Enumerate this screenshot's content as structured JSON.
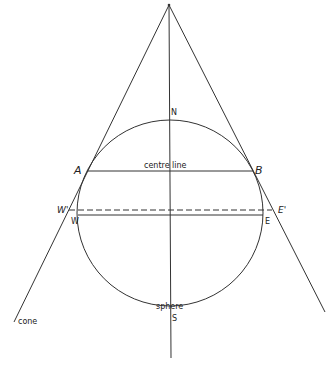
{
  "diagram": {
    "stroke_color": "#333333",
    "background": "#ffffff",
    "labels": {
      "north": "N",
      "south": "S",
      "point_a": "A",
      "point_b": "B",
      "west": "W",
      "east": "E",
      "west_prime": "W'",
      "east_prime": "E'",
      "centre_line": "centre line",
      "sphere": "sphere",
      "cone": "cone"
    },
    "geometry": {
      "apex": [
        169,
        5
      ],
      "sphere_center": [
        170,
        213
      ],
      "sphere_radius": 93,
      "centre_line_y": 171,
      "equator_y": 215,
      "dashed_line_y": 210,
      "axis_bottom_y": 358
    }
  }
}
